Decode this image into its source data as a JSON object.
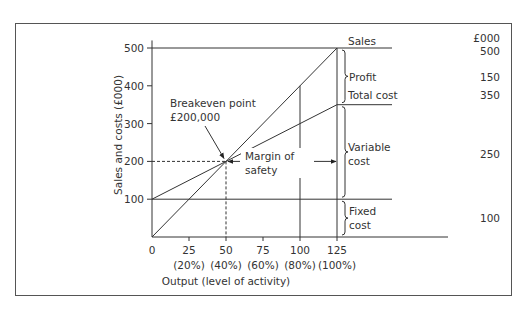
{
  "chart_data": {
    "type": "line",
    "title": "",
    "xlabel": "Output (level of activity)",
    "ylabel": "Sales and costs (£000)",
    "xlim": [
      0,
      125
    ],
    "ylim": [
      0,
      500
    ],
    "grid": false,
    "x_ticks": [
      0,
      25,
      50,
      75,
      100,
      125
    ],
    "x_tick_labels": [
      "0",
      "25",
      "50",
      "75",
      "100",
      "125"
    ],
    "x_tick_sublabels": [
      "",
      "(20%)",
      "(40%)",
      "(60%)",
      "(80%)",
      "(100%)"
    ],
    "y_ticks": [
      100,
      200,
      300,
      400,
      500
    ],
    "y_tick_labels": [
      "100",
      "200",
      "300",
      "400",
      "500"
    ],
    "series": [
      {
        "name": "Sales",
        "x": [
          0,
          125
        ],
        "y": [
          0,
          500
        ]
      },
      {
        "name": "Total cost",
        "x": [
          0,
          125
        ],
        "y": [
          100,
          350
        ]
      },
      {
        "name": "Fixed cost",
        "x": [
          0,
          125
        ],
        "y": [
          100,
          100
        ]
      }
    ],
    "annotations": {
      "breakeven": {
        "label_line1": "Breakeven point",
        "label_line2": "£200,000",
        "x": 50,
        "y": 200
      },
      "margin_of_safety": {
        "label_line1": "Margin of",
        "label_line2": "safety",
        "from_x": 50,
        "to_x": 125,
        "y": 200
      },
      "reference_verticals": [
        100,
        125
      ]
    },
    "right_panel": {
      "unit_header": "£000",
      "rows": [
        {
          "label": "Sales",
          "value": "500"
        },
        {
          "label": "Profit",
          "value": "150"
        },
        {
          "label": "Total cost",
          "value": "350"
        },
        {
          "label_line1": "Variable",
          "label_line2": "cost",
          "value": "250"
        },
        {
          "label_line1": "Fixed",
          "label_line2": "cost",
          "value": "100"
        }
      ]
    }
  }
}
